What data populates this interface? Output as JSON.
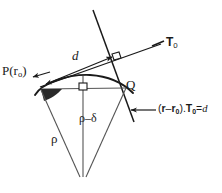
{
  "figure": {
    "type": "geometry-diagram",
    "background_color": "#ffffff",
    "stroke_color": "#1a1a1a",
    "width": 222,
    "height": 193
  },
  "labels": {
    "point_p": {
      "text": "P(r",
      "sub": "o",
      "close": ")"
    },
    "point_q": {
      "text": "Q"
    },
    "tangent_vector": {
      "text": "T",
      "sub": "0"
    },
    "distance_d": {
      "text": "d"
    },
    "radius_rho": {
      "text": "ρ"
    },
    "radius_rho_minus_delta": {
      "text": "ρ–δ"
    },
    "plane_equation": {
      "open": "(",
      "r": "r",
      "minus": "–",
      "r0": "r",
      "r0_sub": "0",
      "close_dot": ").",
      "t": "T",
      "t_sub": "0",
      "equals": "=",
      "d": "d"
    }
  },
  "elements": {
    "arc": "curved-arc",
    "tangent_line": "tangent-line-T0",
    "normal_line": "normal-line-through-Q",
    "chord": "chord-P-to-Q",
    "perpendicular": "perpendicular-drop",
    "radius_left": "radius-to-P",
    "radius_right": "radius-to-Q",
    "angle_wedge": "filled-angle-at-P",
    "right_angle_upper": "right-angle-marker-tangent",
    "right_angle_lower": "right-angle-marker-chord",
    "arrow_d": "double-arrow-distance-d",
    "arrow_p": "arrow-to-point-P",
    "arrow_eqn": "arrow-to-equation"
  },
  "colors": {
    "stroke": "#1a1a1a",
    "background": "#ffffff",
    "wedge_fill": "#2a2a2a"
  }
}
